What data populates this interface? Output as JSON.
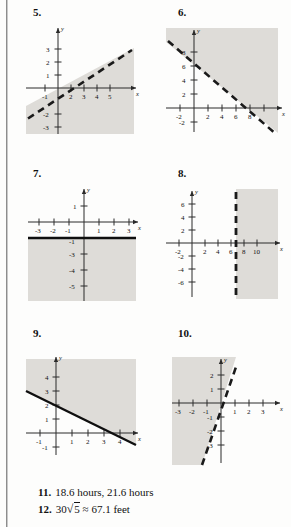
{
  "page": {
    "width": 291,
    "height": 527,
    "background": "#fdfdfc",
    "shade_color": "#dedcd8",
    "line_color": "#1a1a1a"
  },
  "problems": [
    {
      "number": "5.",
      "axis_labels": {
        "x": "x",
        "y": "y"
      },
      "x_ticks": [
        "-1",
        "2",
        "3",
        "4",
        "5"
      ],
      "y_ticks": [
        "3",
        "2",
        "1",
        "-2",
        "-3"
      ],
      "line_style": "dashed",
      "line_points": [
        [
          -1.4,
          -2.6
        ],
        [
          5.4,
          2.6
        ]
      ],
      "shade": "below-right"
    },
    {
      "number": "6.",
      "axis_labels": {
        "x": "x",
        "y": "y"
      },
      "x_ticks": [
        "-2",
        "2",
        "4",
        "6",
        "8"
      ],
      "y_ticks": [
        "8",
        "6",
        "4",
        "2",
        "-2"
      ],
      "line_style": "dashed",
      "line_points": [
        [
          -3.2,
          9.2
        ],
        [
          9.2,
          -3.2
        ]
      ],
      "shade": "above-right"
    },
    {
      "number": "7.",
      "axis_labels": {
        "x": "x",
        "y": "y"
      },
      "x_ticks": [
        "-3",
        "-2",
        "-1",
        "1",
        "2",
        "3"
      ],
      "y_ticks": [
        "1",
        "-1",
        "-3",
        "-4",
        "-5"
      ],
      "line_style": "solid",
      "line_points": [
        [
          -3.9,
          -2
        ],
        [
          3.9,
          -2
        ]
      ],
      "shade": "below"
    },
    {
      "number": "8.",
      "axis_labels": {
        "x": "x",
        "y": "y"
      },
      "x_ticks": [
        "-2",
        "2",
        "4",
        "6",
        "8",
        "10"
      ],
      "y_ticks": [
        "6",
        "4",
        "2",
        "-2",
        "-4",
        "-6"
      ],
      "line_style": "dashed",
      "line_points": [
        [
          7,
          -7.6
        ],
        [
          7,
          7.6
        ]
      ],
      "shade": "right"
    },
    {
      "number": "9.",
      "axis_labels": {
        "x": "x",
        "y": "y"
      },
      "x_ticks": [
        "-1",
        "1",
        "2",
        "3",
        "4"
      ],
      "y_ticks": [
        "4",
        "3",
        "2",
        "1",
        "-1"
      ],
      "line_style": "solid",
      "line_points": [
        [
          -1.6,
          3.07
        ],
        [
          4.4,
          -0.93
        ]
      ],
      "shade": "above"
    },
    {
      "number": "10.",
      "axis_labels": {
        "x": "x",
        "y": "y"
      },
      "x_ticks": [
        "-3",
        "-2",
        "-1",
        "1",
        "2",
        "3"
      ],
      "y_ticks": [
        "2",
        "1",
        "-1",
        "-2",
        "-3"
      ],
      "line_style": "dashed",
      "line_points": [
        [
          -0.55,
          -4.65
        ],
        [
          1.85,
          2.55
        ]
      ],
      "shade": "left-above"
    }
  ],
  "answers": [
    {
      "label": "11.",
      "text": "18.6 hours, 21.6 hours"
    },
    {
      "label": "12.",
      "prefix": "30",
      "radicand": "5",
      "suffix": "≈ 67.1 feet"
    }
  ]
}
